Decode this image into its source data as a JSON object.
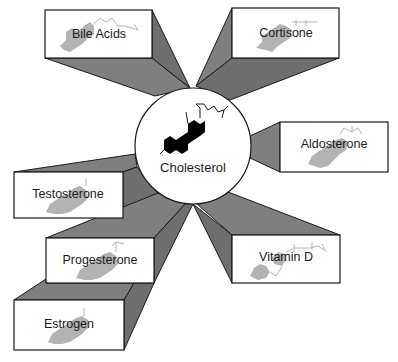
{
  "diagram": {
    "center": {
      "label": "Cholesterol",
      "icon": "steroid-molecule-icon"
    },
    "products": [
      {
        "id": "bile-acids",
        "label": "Bile Acids"
      },
      {
        "id": "cortisone",
        "label": "Cortisone"
      },
      {
        "id": "aldosterone",
        "label": "Aldosterone"
      },
      {
        "id": "testosterone",
        "label": "Testosterone"
      },
      {
        "id": "progesterone",
        "label": "Progesterone"
      },
      {
        "id": "estrogen",
        "label": "Estrogen"
      },
      {
        "id": "vitamin-d",
        "label": "Vitamin D"
      }
    ],
    "colors": {
      "beam": "#7f7f7f",
      "outline": "#1a1a1a",
      "molecule_faded": "#b3b3b3",
      "molecule_center": "#000000",
      "background": "#ffffff"
    }
  }
}
